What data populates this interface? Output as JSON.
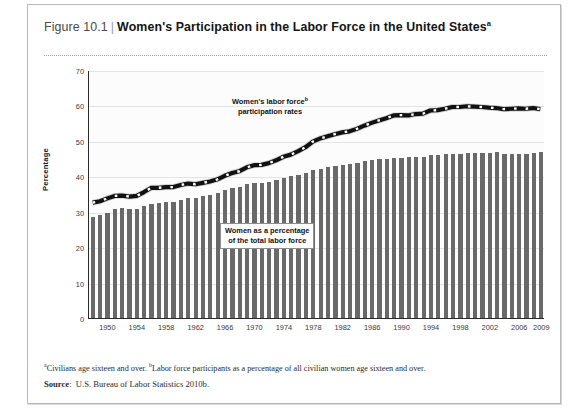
{
  "figure": {
    "number": "Figure 10.1",
    "separator": "|",
    "title": "Women's Participation in the Labor Force in the United States",
    "title_superscript": "a"
  },
  "footnotes": {
    "marker_a": "a",
    "text_a": "Civilians age sixteen and over. ",
    "marker_b": "b",
    "text_b": "Labor force participants as a percentage of all civilian women age sixteen and over.",
    "source_label": "Source",
    "source_sep": ":",
    "source_text": "U.S. Bureau of Labor Statistics 2010b."
  },
  "annotations": {
    "line_label_l1": "Women's labor force",
    "line_label_sup": "b",
    "line_label_l2": "participation rates",
    "bar_label_l1": "Women as a percentage",
    "bar_label_l2": "of the total labor force"
  },
  "colors": {
    "bar": "#696969",
    "line": "#111111",
    "line_dash": "#ffffff",
    "axis": "#2a2a2a",
    "grid": "#e4e4e4",
    "plot_background": "#fcfcfc",
    "card_border": "#b8b8b8"
  },
  "chart_data": {
    "type": "bar",
    "title": "Women's Participation in the Labor Force in the United States",
    "xlabel": "",
    "ylabel": "Percentage",
    "ylim": [
      0,
      70
    ],
    "yticks": [
      0,
      10,
      20,
      30,
      40,
      50,
      60,
      70
    ],
    "grid": true,
    "legend_position": "in-plot annotations",
    "x": [
      1948,
      1949,
      1950,
      1951,
      1952,
      1953,
      1954,
      1955,
      1956,
      1957,
      1958,
      1959,
      1960,
      1961,
      1962,
      1963,
      1964,
      1965,
      1966,
      1967,
      1968,
      1969,
      1970,
      1971,
      1972,
      1973,
      1974,
      1975,
      1976,
      1977,
      1978,
      1979,
      1980,
      1981,
      1982,
      1983,
      1984,
      1985,
      1986,
      1987,
      1988,
      1989,
      1990,
      1991,
      1992,
      1993,
      1994,
      1995,
      1996,
      1997,
      1998,
      1999,
      2000,
      2001,
      2002,
      2003,
      2004,
      2005,
      2006,
      2007,
      2008,
      2009
    ],
    "xtick_labels": [
      "1950",
      "1954",
      "1958",
      "1962",
      "1966",
      "1970",
      "1974",
      "1978",
      "1982",
      "1986",
      "1990",
      "1994",
      "1998",
      "2002",
      "2006",
      "2009"
    ],
    "xtick_values": [
      1950,
      1954,
      1958,
      1962,
      1966,
      1970,
      1974,
      1978,
      1982,
      1986,
      1990,
      1994,
      1998,
      2002,
      2006,
      2009
    ],
    "series": [
      {
        "name": "Women as a percentage of the total labor force",
        "type": "bar",
        "color": "#696969",
        "values": [
          28.6,
          29.0,
          29.6,
          30.7,
          31.0,
          30.8,
          30.9,
          31.6,
          32.2,
          32.5,
          32.7,
          32.7,
          33.4,
          33.8,
          34.0,
          34.4,
          34.8,
          35.2,
          36.0,
          36.7,
          37.1,
          37.8,
          38.1,
          38.2,
          38.5,
          38.9,
          39.4,
          40.0,
          40.5,
          41.0,
          41.7,
          42.1,
          42.5,
          43.0,
          43.3,
          43.5,
          43.8,
          44.2,
          44.5,
          44.8,
          45.0,
          45.2,
          45.3,
          45.4,
          45.5,
          45.5,
          46.0,
          46.1,
          46.2,
          46.2,
          46.3,
          46.5,
          46.6,
          46.6,
          46.6,
          47.0,
          46.4,
          46.4,
          46.3,
          46.4,
          46.5,
          46.8
        ]
      },
      {
        "name": "Women's labor force participation rates",
        "type": "line",
        "color": "#111111",
        "style": "dashed",
        "values": [
          32.7,
          33.1,
          33.9,
          34.6,
          34.7,
          34.4,
          34.6,
          35.7,
          36.9,
          36.9,
          37.1,
          37.1,
          37.7,
          38.1,
          37.9,
          38.3,
          38.7,
          39.3,
          40.3,
          41.1,
          41.6,
          42.7,
          43.3,
          43.4,
          43.9,
          44.7,
          45.7,
          46.3,
          47.3,
          48.4,
          50.0,
          50.9,
          51.5,
          52.1,
          52.6,
          52.9,
          53.6,
          54.5,
          55.3,
          56.0,
          56.6,
          57.4,
          57.5,
          57.4,
          57.8,
          57.9,
          58.8,
          58.9,
          59.3,
          59.8,
          59.8,
          60.0,
          59.9,
          59.8,
          59.6,
          59.5,
          59.2,
          59.3,
          59.4,
          59.3,
          59.5,
          59.2
        ]
      }
    ]
  }
}
